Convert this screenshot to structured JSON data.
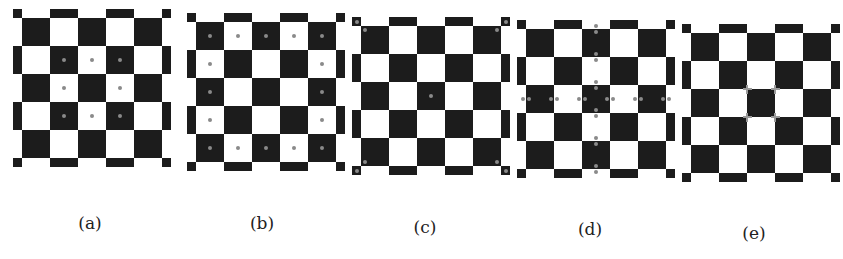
{
  "figure": {
    "grid": {
      "rows": 5,
      "cols": 5,
      "cell_px": 28,
      "top_left_dark": true
    },
    "colors": {
      "dark": "#1c1c1c",
      "light": "#ffffff",
      "marker": "#8a8a8a"
    },
    "panels": [
      {
        "label": "(a)",
        "origin": [
          22,
          18
        ],
        "label_pos": [
          90,
          226
        ],
        "markers": "inner-ring-centers"
      },
      {
        "label": "(b)",
        "origin": [
          196,
          22
        ],
        "label_pos": [
          262,
          226
        ],
        "markers": "border-cell-centers"
      },
      {
        "label": "(c)",
        "origin": [
          361,
          26
        ],
        "label_pos": [
          425,
          230
        ],
        "markers": "outer-corners-and-center"
      },
      {
        "label": "(d)",
        "origin": [
          526,
          29
        ],
        "label_pos": [
          590,
          232
        ],
        "markers": "middle-row-col-pairs"
      },
      {
        "label": "(e)",
        "origin": [
          691,
          33
        ],
        "label_pos": [
          754,
          236
        ],
        "markers": "center-cell-corner-crosses"
      }
    ]
  }
}
